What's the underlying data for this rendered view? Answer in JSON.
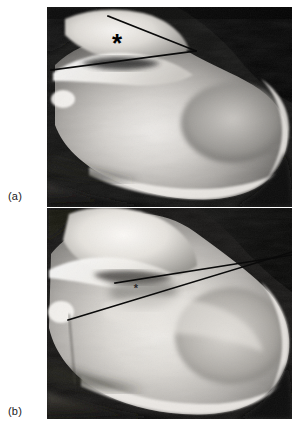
{
  "figure": {
    "kind": "radiograph-figure",
    "background_color": "#ffffff",
    "panel_count": 2
  },
  "panels": [
    {
      "id": "a",
      "label": "(a)",
      "modality": "x-ray",
      "view": "lateral calcaneus",
      "marker": {
        "symbol": "*",
        "name": "asterisk-marker",
        "size": "large",
        "x": 117,
        "y": 48,
        "color": "#000000"
      },
      "angle_lines": [
        {
          "name": "superior-tuberosity-line",
          "x1": 108,
          "y1": 16,
          "x2": 196,
          "y2": 51,
          "color": "#0a0a0a",
          "width": 1.6
        },
        {
          "name": "posterior-facet-line",
          "x1": 51,
          "y1": 70,
          "x2": 196,
          "y2": 51,
          "color": "#0a0a0a",
          "width": 1.6
        }
      ],
      "image_box": {
        "x": 47,
        "y": 7,
        "w": 245,
        "h": 200
      }
    },
    {
      "id": "b",
      "label": "(b)",
      "modality": "x-ray",
      "view": "lateral calcaneus",
      "marker": {
        "symbol": "*",
        "name": "asterisk-marker",
        "size": "small",
        "x": 136,
        "y": 288,
        "color": "#2a2a2a"
      },
      "angle_lines": [
        {
          "name": "superior-tuberosity-line",
          "x1": 115,
          "y1": 283,
          "x2": 285,
          "y2": 255,
          "color": "#0a0a0a",
          "width": 1.5
        },
        {
          "name": "posterior-facet-line",
          "x1": 68,
          "y1": 320,
          "x2": 285,
          "y2": 252,
          "color": "#0a0a0a",
          "width": 1.5
        }
      ],
      "image_box": {
        "x": 47,
        "y": 208,
        "w": 245,
        "h": 211
      }
    }
  ],
  "colors": {
    "page_background": "#ffffff",
    "label_text": "#1b1b1b",
    "line_stroke": "#0a0a0a",
    "bone_bright": "#e8e6e2",
    "bone_mid": "#b4b2ae",
    "soft_tissue": "#7a7874",
    "film_dark": "#141414",
    "film_black": "#050505"
  }
}
